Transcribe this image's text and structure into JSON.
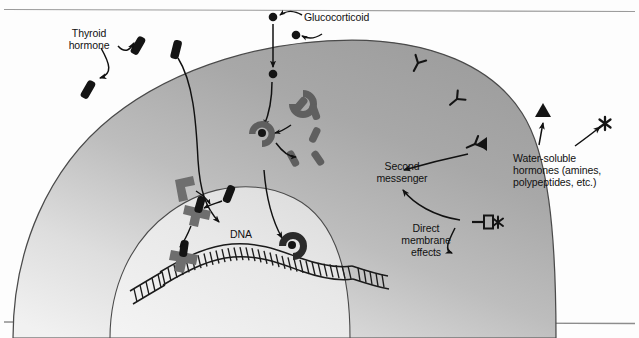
{
  "figure": {
    "labels": {
      "thyroid_hormone": "Thyroid\nhormone",
      "glucocorticoid": "Glucocorticoid",
      "second_messenger": "Second\nmessenger",
      "direct_membrane_effects": "Direct\nmembrane\neffects",
      "water_soluble_hormones": "Water-soluble\nhormones (amines,\npolypeptides, etc.)",
      "dna": "DNA"
    },
    "colors": {
      "cytoplasm_dark": "#a4a4a4",
      "cytoplasm_light": "#e6e6e6",
      "nucleus_fill": "#e9e9e9",
      "outline": "#3d3d3d",
      "protein_gray": "#6e6e6e",
      "hormone_black": "#141414",
      "text": "#111111",
      "rule": "#8d8d8d",
      "background": "#fdfdfd"
    },
    "structures": {
      "cell": "target cell with graded gray cytoplasm",
      "nucleus": "nucleus containing DNA strand",
      "dna_strand": "double-stranded DNA ladder",
      "membrane_receptors": "Y-shaped surface receptors",
      "channel_receptor": "membrane channel with star ligand",
      "cytoplasmic_receptor": "C-shaped cytoplasmic receptor complex",
      "nuclear_receptors": "nuclear receptor proteins bound to hormone"
    },
    "icons": {
      "hormone_bar": "thyroid-hormone-bar",
      "hormone_dot": "glucocorticoid-dot",
      "hormone_triangle": "water-soluble-triangle",
      "hormone_star": "water-soluble-star",
      "receptor_y": "y-receptor",
      "arrow": "arrow"
    },
    "counts": {
      "surface_receptors": 3,
      "extracellular_thyroid_bars": 3,
      "extracellular_glucocorticoid_dots": 2,
      "cytoplasmic_subunits": 5
    }
  }
}
